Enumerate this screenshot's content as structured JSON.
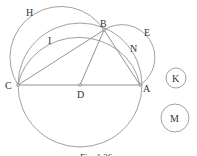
{
  "figure": {
    "caption": "Fig. 1.36",
    "points": [
      {
        "id": "A",
        "label": "A",
        "x": 140,
        "y": 85,
        "lx": 143,
        "ly": 92
      },
      {
        "id": "B",
        "label": "B",
        "x": 104,
        "y": 30,
        "lx": 100,
        "ly": 27
      },
      {
        "id": "C",
        "label": "C",
        "x": 18,
        "y": 85,
        "lx": 5,
        "ly": 89
      },
      {
        "id": "D",
        "label": "D",
        "x": 80,
        "y": 85,
        "lx": 77,
        "ly": 98
      }
    ],
    "arc_labels": [
      {
        "label": "H",
        "x": 26,
        "y": 16
      },
      {
        "label": "I",
        "x": 48,
        "y": 44
      },
      {
        "label": "E",
        "x": 144,
        "y": 36
      },
      {
        "label": "N",
        "x": 130,
        "y": 52
      }
    ],
    "side_circles": [
      {
        "label": "K",
        "cx": 176,
        "cy": 78,
        "r": 10
      },
      {
        "label": "M",
        "cx": 175,
        "cy": 118,
        "r": 14
      }
    ],
    "line_color": "#777777"
  }
}
